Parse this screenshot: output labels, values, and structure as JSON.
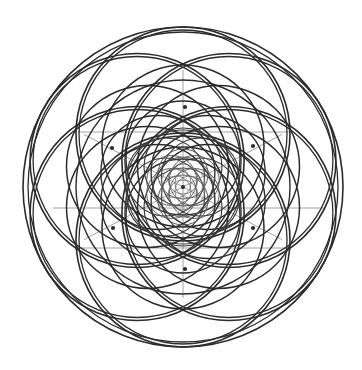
{
  "document": {
    "title": "Sacred Geometry Mandala",
    "background_color": "#ffffff",
    "width": 362,
    "height": 370
  },
  "figure": {
    "name": "flower-of-life-mandala",
    "symmetry_order": 6,
    "center": {
      "x": 183,
      "y": 187
    },
    "outer_radius": 160,
    "stroke_color": "#2b2b2b",
    "guide_color": "#8c8c8c",
    "stroke_width_outer": 1.6,
    "stroke_width_mid": 1.5,
    "stroke_width_inner": 1.1,
    "guide_stroke_width": 0.8
  },
  "chart_data": {
    "type": "scatter",
    "xlabel": "",
    "ylabel": "",
    "grid": false,
    "legend": "none",
    "xlim": [
      0,
      362
    ],
    "ylim": [
      0,
      370
    ],
    "center": {
      "x": 183,
      "y": 187
    },
    "generations": [
      {
        "name": "outer-ring",
        "circle_radius": 107,
        "center_offset": 53,
        "count": 6,
        "start_angle_deg": -90,
        "stroke": "#2b2b2b",
        "stroke_width": 1.6
      },
      {
        "name": "outer-ring-duplicate",
        "circle_radius": 104,
        "center_offset": 53,
        "count": 6,
        "start_angle_deg": -90,
        "stroke": "#2b2b2b",
        "stroke_width": 1.3
      },
      {
        "name": "second-ring",
        "circle_radius": 81,
        "center_offset": 41,
        "count": 6,
        "start_angle_deg": -90,
        "stroke": "#2b2b2b",
        "stroke_width": 1.5
      },
      {
        "name": "third-ring",
        "circle_radius": 57,
        "center_offset": 29,
        "count": 6,
        "start_angle_deg": -90,
        "stroke": "#2b2b2b",
        "stroke_width": 1.35
      },
      {
        "name": "fourth-ring",
        "circle_radius": 39,
        "center_offset": 20,
        "count": 6,
        "start_angle_deg": -90,
        "stroke": "#3a3a3a",
        "stroke_width": 1.15
      },
      {
        "name": "fifth-ring",
        "circle_radius": 25,
        "center_offset": 13,
        "count": 6,
        "start_angle_deg": -90,
        "stroke": "#555555",
        "stroke_width": 0.95
      },
      {
        "name": "sixth-ring",
        "circle_radius": 15,
        "center_offset": 8,
        "count": 6,
        "start_angle_deg": -90,
        "stroke": "#6a6a6a",
        "stroke_width": 0.8
      }
    ],
    "concentric_circles": [
      {
        "name": "bounding-circle-outer",
        "radius": 160,
        "stroke": "#2b2b2b",
        "stroke_width": 1.6
      },
      {
        "name": "bounding-circle-inner",
        "radius": 155,
        "stroke": "#2b2b2b",
        "stroke_width": 1.3
      },
      {
        "name": "mid-circle",
        "radius": 107,
        "stroke": "#2b2b2b",
        "stroke_width": 1.4
      },
      {
        "name": "inner-circle",
        "radius": 57,
        "stroke": "#3a3a3a",
        "stroke_width": 1.1
      },
      {
        "name": "core-circle",
        "radius": 30,
        "stroke": "#5a5a5a",
        "stroke_width": 0.9
      }
    ],
    "vertices": [
      {
        "name": "node-top",
        "x": 185,
        "y": 107
      },
      {
        "name": "node-upper-left",
        "x": 112,
        "y": 148
      },
      {
        "name": "node-upper-right",
        "x": 253,
        "y": 146
      },
      {
        "name": "node-lower-left",
        "x": 113,
        "y": 228
      },
      {
        "name": "node-lower-right",
        "x": 253,
        "y": 228
      },
      {
        "name": "node-bottom",
        "x": 185,
        "y": 269
      },
      {
        "name": "node-center",
        "x": 183,
        "y": 187
      }
    ],
    "guide_axes": [
      {
        "name": "axis-horizontal",
        "x1": 53,
        "y1": 208,
        "x2": 325,
        "y2": 208,
        "stroke": "#8c8c8c"
      },
      {
        "name": "axis-vertical",
        "x1": 183,
        "y1": 70,
        "x2": 183,
        "y2": 298,
        "stroke": "#8c8c8c"
      },
      {
        "name": "axis-diagonal-up",
        "x1": 78,
        "y1": 132,
        "x2": 290,
        "y2": 132,
        "stroke": "#8c8c8c"
      },
      {
        "name": "axis-diagonal-down",
        "x1": 78,
        "y1": 248,
        "x2": 290,
        "y2": 248,
        "stroke": "#8c8c8c"
      }
    ],
    "radial_guides": {
      "name": "radial-spokes",
      "count": 4,
      "length": 112,
      "angles_deg": [
        28,
        152,
        208,
        332
      ],
      "stroke": "#8c8c8c"
    }
  }
}
